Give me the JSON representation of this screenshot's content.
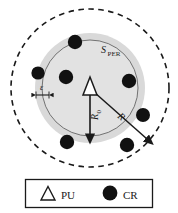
{
  "figure": {
    "type": "network-coverage-diagram",
    "labels": {
      "s_per_main": "S",
      "s_per_sub": "PER",
      "epsilon": "ε",
      "r0_main": "R",
      "r0_sub": "0",
      "r": "R"
    },
    "colors": {
      "stroke": "#1a1a1a",
      "band_fill": "#d9d9d9",
      "inner_fill": "#e3e3e3",
      "node_fill": "#111111",
      "background": "#ffffff"
    }
  },
  "geometry": {
    "center": {
      "x": 90,
      "y": 88
    },
    "outer_dashed_radius": 79,
    "band_outer_radius": 55,
    "band_inner_radius": 48,
    "arrow_r0_end": {
      "x": 90,
      "y": 137
    },
    "arrow_r_end": {
      "x": 148,
      "y": 140
    }
  },
  "nodes": {
    "pu": [
      {
        "name": "primary-user",
        "x": 90,
        "y": 88
      }
    ],
    "cr": [
      {
        "x": 75,
        "y": 42
      },
      {
        "x": 38,
        "y": 73
      },
      {
        "x": 66,
        "y": 77
      },
      {
        "x": 129,
        "y": 81
      },
      {
        "x": 143,
        "y": 115
      },
      {
        "x": 67,
        "y": 142
      },
      {
        "x": 127,
        "y": 145
      }
    ]
  },
  "legend": {
    "items": [
      {
        "symbol": "triangle-outline",
        "label": "PU"
      },
      {
        "symbol": "filled-circle",
        "label": "CR"
      }
    ],
    "box": {
      "x": 25,
      "y": 179,
      "width": 128,
      "height": 29
    }
  }
}
